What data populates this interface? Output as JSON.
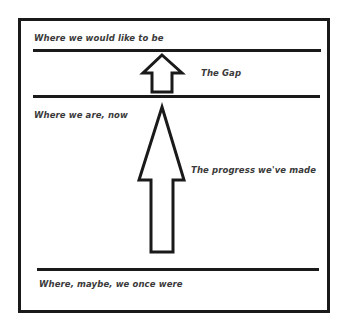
{
  "diagram": {
    "type": "gap-progress-diagram",
    "levels": [
      {
        "id": "target",
        "label": "Where we would like to be"
      },
      {
        "id": "current",
        "label": "Where we are, now"
      },
      {
        "id": "origin",
        "label": "Where, maybe, we once were"
      }
    ],
    "arrows": [
      {
        "id": "gap",
        "label": "The Gap",
        "from": "current",
        "to": "target"
      },
      {
        "id": "progress",
        "label": "The progress we've made",
        "from": "origin",
        "to": "current"
      }
    ],
    "colors": {
      "stroke": "#1a1a1a",
      "text": "#3a3a3a",
      "background": "#ffffff"
    }
  }
}
